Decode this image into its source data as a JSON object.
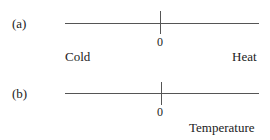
{
  "panels": [
    {
      "id": "a",
      "label": "(a)",
      "zero_label": "0",
      "left_label": "Cold",
      "right_label": "Heat"
    },
    {
      "id": "b",
      "label": "(b)",
      "zero_label": "0",
      "right_label": "Temperature"
    }
  ]
}
